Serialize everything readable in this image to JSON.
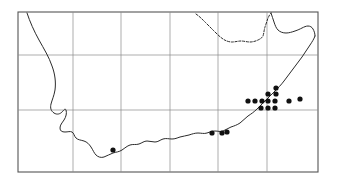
{
  "figure": {
    "title": "",
    "type": "distribution-map",
    "region": "Southern Africa",
    "width": 337,
    "height": 186,
    "background_color": "#ffffff"
  },
  "frame": {
    "x": 18,
    "y": 12,
    "width": 300,
    "height": 160,
    "stroke_color": "#555555",
    "stroke_width": 1.1
  },
  "graticule": {
    "stroke_color": "#8a8a8a",
    "stroke_width": 0.7,
    "vertical_lines": [
      73,
      121,
      170,
      218,
      267
    ],
    "horizontal_lines": [
      55,
      110
    ]
  },
  "outline": {
    "stroke_color": "#2b2b2b",
    "stroke_width": 1.0,
    "coast_path": "M 27 13 C 30 22, 34 31, 39 40 C 44 49, 49 57, 52 66 C 55 74, 56 82, 55 90 C 54 96, 52 100, 51 104 C 50 108, 51 111, 54 113 C 57 115, 60 114, 62 112 C 64 110, 65 108, 66 110 C 67 113, 66 117, 64 120 C 62 123, 60 125, 60 128 C 60 131, 62 132, 65 132 C 68 132, 70 131, 72 132 C 74 133, 74 136, 76 138 C 78 140, 81 140, 84 141 C 87 142, 89 144, 91 147 C 93 150, 94 153, 96 155 C 98 157, 101 158, 104 157 C 107 156, 110 154, 113 153 C 116 152, 119 152, 122 150 C 125 148, 127 146, 130 145 C 133 144, 136 145, 139 144 C 142 143, 144 141, 147 141 C 150 141, 152 142, 155 142 C 158 142, 160 140, 163 139 C 166 138, 169 139, 172 139 C 175 139, 177 138, 180 137 C 183 136, 186 136, 189 135 C 192 134, 195 133, 198 133 C 201 133, 204 134, 207 133 C 210 132, 212 131, 215 131 C 218 131, 220 132, 223 131 C 226 130, 228 128, 231 127 C 234 126, 237 125, 240 123 C 243 121, 245 118, 248 116 C 251 114, 254 112, 257 109 C 260 106, 263 103, 266 100 C 269 97, 272 94, 275 91 C 278 88, 281 85, 284 81 C 287 77, 290 73, 293 69 C 296 65, 299 61, 302 57 C 305 53, 307 49, 310 45 C 312 42, 314 39, 315 36",
    "north_border_path": "M 196 14 C 199 16, 202 19, 205 22 C 208 25, 211 28, 214 31 C 217 34, 220 37, 223 39 C 226 41, 229 42, 232 42 C 235 42, 238 41, 241 41 C 244 41, 247 42, 250 42 C 253 42, 256 41, 258 40 C 260 39, 262 38, 263 36 C 264 33, 264 30, 265 27 C 266 24, 267 21, 268 18 C 269 16, 270 14, 271 13",
    "north_border_dashed": true,
    "northeast_path": "M 271 13 C 272 16, 273 19, 274 22 C 275 25, 276 28, 278 30 C 280 32, 283 33, 286 33 C 289 33, 292 32, 295 31 C 298 30, 300 29, 302 28 C 304 27, 306 26, 308 26 C 310 26, 312 27, 313 29 C 314 31, 315 33, 315 36"
  },
  "occurrence_points": {
    "marker": "filled-circle",
    "fill_color": "#111111",
    "radius": 2.6,
    "count": 16,
    "points": [
      {
        "x": 248,
        "y": 101,
        "label": "point-1"
      },
      {
        "x": 255,
        "y": 101,
        "label": "point-2"
      },
      {
        "x": 262,
        "y": 101,
        "label": "point-3"
      },
      {
        "x": 268,
        "y": 101,
        "label": "point-4"
      },
      {
        "x": 268,
        "y": 94,
        "label": "point-5"
      },
      {
        "x": 268,
        "y": 108,
        "label": "point-6"
      },
      {
        "x": 261,
        "y": 108,
        "label": "point-7"
      },
      {
        "x": 275,
        "y": 101,
        "label": "point-8"
      },
      {
        "x": 275,
        "y": 108,
        "label": "point-9"
      },
      {
        "x": 276,
        "y": 94,
        "label": "point-10"
      },
      {
        "x": 276,
        "y": 88,
        "label": "point-11"
      },
      {
        "x": 289,
        "y": 101,
        "label": "point-12"
      },
      {
        "x": 300,
        "y": 99,
        "label": "point-13"
      },
      {
        "x": 212,
        "y": 133,
        "label": "point-14"
      },
      {
        "x": 222,
        "y": 133,
        "label": "point-15"
      },
      {
        "x": 227,
        "y": 132,
        "label": "point-16"
      },
      {
        "x": 113,
        "y": 150,
        "label": "point-17"
      }
    ]
  },
  "chart_data": {
    "type": "scatter",
    "title": "",
    "xlabel": "",
    "ylabel": "",
    "x": [
      248,
      255,
      262,
      268,
      268,
      268,
      261,
      275,
      275,
      276,
      276,
      289,
      300,
      212,
      222,
      227,
      113
    ],
    "y": [
      101,
      101,
      101,
      101,
      94,
      108,
      108,
      101,
      108,
      94,
      88,
      101,
      99,
      133,
      133,
      132,
      150
    ],
    "xlim": [
      18,
      318
    ],
    "ylim": [
      12,
      172
    ],
    "grid": true,
    "legend": "none"
  }
}
